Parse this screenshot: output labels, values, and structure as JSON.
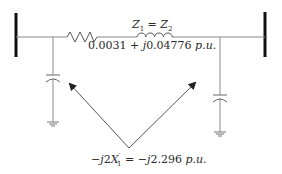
{
  "diagram": {
    "series_impedance": {
      "label_lhs": "Z",
      "label_lhs_sub": "1",
      "label_eq": " = ",
      "label_rhs": "Z",
      "label_rhs_sub": "2",
      "value_real": "0.0031 + ",
      "value_imag": "j",
      "value_imag_num": "0.04776",
      "unit": " p.u."
    },
    "shunt_admittance": {
      "prefix": "−",
      "j": "j",
      "coef": "2",
      "X": "X",
      "X_sub": "1",
      "X_sup": "′",
      "eq": " = −",
      "j2": "j",
      "value": "2.296",
      "unit": " p.u."
    },
    "components": [
      "left-bus",
      "right-bus",
      "series-resistor",
      "series-inductor",
      "left-shunt-capacitor",
      "right-shunt-capacitor",
      "left-ground",
      "right-ground",
      "pointer-arrows"
    ],
    "colors": {
      "bus": "#111111",
      "wire": "#8a8a8a",
      "arrow": "#555555",
      "text": "#2a2a2a"
    }
  }
}
